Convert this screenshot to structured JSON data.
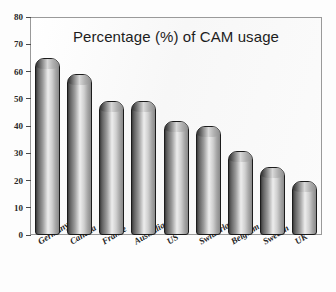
{
  "chart_data": {
    "type": "bar",
    "title": "Percentage (%) of CAM usage",
    "xlabel": "",
    "ylabel": "",
    "ylim": [
      0,
      80
    ],
    "yticks": [
      0,
      10,
      20,
      30,
      40,
      50,
      60,
      70,
      80
    ],
    "grid": false,
    "legend": null,
    "categories": [
      "Germany",
      "Canada",
      "France",
      "Australia",
      "US",
      "Switzerland",
      "Belgium",
      "Sweden",
      "UK"
    ],
    "values": [
      65,
      59,
      49,
      49,
      42,
      40,
      31,
      25,
      20
    ],
    "bars": [
      {
        "label": "Germany",
        "value": 65
      },
      {
        "label": "Canada",
        "value": 59
      },
      {
        "label": "France",
        "value": 49
      },
      {
        "label": "Australia",
        "value": 49
      },
      {
        "label": "US",
        "value": 42
      },
      {
        "label": "Switzerland",
        "value": 40
      },
      {
        "label": "Belgium",
        "value": 31
      },
      {
        "label": "Sweden",
        "value": 25
      },
      {
        "label": "UK",
        "value": 20
      }
    ],
    "colors": {
      "bar_dark": "#3a3a3a",
      "bar_highlight": "#ededed",
      "bar_outline": "#1c1c1c",
      "plot_background": "#fafafa",
      "frame": "#9a9a9a",
      "text": "#1d1d1d"
    }
  }
}
